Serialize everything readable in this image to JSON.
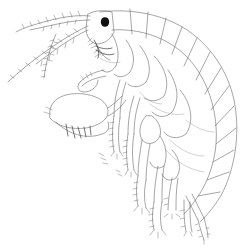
{
  "figure": {
    "subject": "amphipod crustacean, lateral view line drawing",
    "background": "#ffffff",
    "line_color": "#6a6a6a",
    "eye_color": "#111111",
    "parts": [
      "antenna-1",
      "antenna-2",
      "head",
      "eye",
      "pereon-segments",
      "pleon-segments",
      "gnathopod",
      "pereopods",
      "uropods",
      "telson"
    ]
  }
}
